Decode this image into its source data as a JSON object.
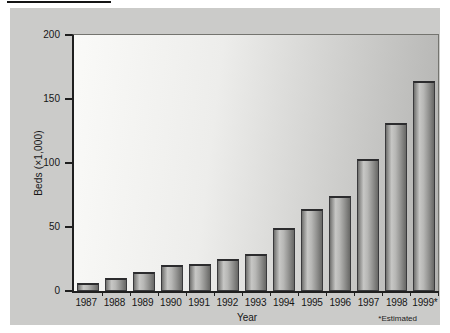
{
  "chart_data": {
    "type": "bar",
    "title": "",
    "categories": [
      "1987",
      "1988",
      "1989",
      "1990",
      "1991",
      "1992",
      "1993",
      "1994",
      "1995",
      "1996",
      "1997",
      "1998",
      "1999*"
    ],
    "values": [
      6,
      10,
      15,
      20,
      21,
      25,
      29,
      49,
      64,
      74,
      103,
      131,
      164
    ],
    "xlabel": "Year",
    "ylabel": "Beds (×1,000)",
    "ylim": [
      0,
      200
    ],
    "y_ticks": [
      0,
      50,
      100,
      150,
      200
    ],
    "grid": false,
    "legend": "none",
    "footnote": "*Estimated"
  },
  "colors": {
    "panel_background": "#cbcbc9",
    "plot_gradient_left": "#fafaf8",
    "plot_gradient_right": "#b2b2b0",
    "bar_highlight": "#c7c7c5",
    "bar_shadow": "#686866",
    "axis": "#1f1f1f",
    "text": "#161616"
  }
}
